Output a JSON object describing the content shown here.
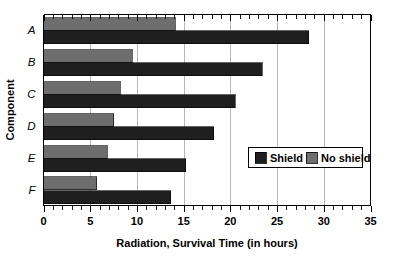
{
  "chart_data": {
    "type": "bar",
    "orientation": "horizontal",
    "title": "",
    "xlabel": "Radiation, Survival Time (in hours)",
    "ylabel": "Component",
    "categories": [
      "A",
      "B",
      "C",
      "D",
      "E",
      "F"
    ],
    "series": [
      {
        "name": "Shield",
        "color": "#1f1f1f",
        "values": [
          28.4,
          23.4,
          20.5,
          18.2,
          15.2,
          13.6
        ]
      },
      {
        "name": "No shield",
        "color": "#6e6e6e",
        "values": [
          14.1,
          9.5,
          8.2,
          7.5,
          6.8,
          5.7
        ]
      }
    ],
    "xlim": [
      0,
      35
    ],
    "xticks": [
      0,
      5,
      10,
      15,
      20,
      25,
      30,
      35
    ],
    "xtick_labels": [
      "0",
      "5",
      "10",
      "15",
      "20",
      "25",
      "30",
      "35"
    ],
    "minor_tick_step": 1,
    "grid": "vertical-major",
    "grid_color": "#b8b8b8",
    "legend": {
      "position": "inside-right",
      "entries": [
        {
          "label": "Shield",
          "color": "#1f1f1f"
        },
        {
          "label": "No shield",
          "color": "#6e6e6e"
        }
      ]
    }
  },
  "colors": {
    "shield": "#1f1f1f",
    "no_shield": "#6e6e6e",
    "axis": "#000000",
    "grid": "#b8b8b8",
    "background": "#ffffff"
  }
}
